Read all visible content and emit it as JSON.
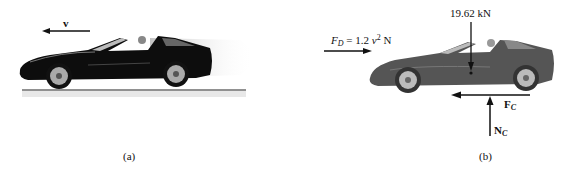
{
  "figure": {
    "panels": [
      {
        "id": "a",
        "caption": "(a)",
        "velocity_label": "v",
        "description": "Black sports car moving left with velocity v on a road surface"
      },
      {
        "id": "b",
        "caption": "(b)",
        "drag_force": {
          "symbol": "F",
          "subscript": "D",
          "equals": "= 1.2",
          "variable": "v",
          "power": "2",
          "unit": "N"
        },
        "weight_label": "19.62 kN",
        "friction_force": {
          "symbol": "F",
          "subscript": "C"
        },
        "normal_force": {
          "symbol": "N",
          "subscript": "C"
        },
        "description": "Free-body diagram of the car with drag, weight, friction and normal forces"
      }
    ],
    "colors": {
      "car_a": "#0d0d0d",
      "car_b": "#555555",
      "arrow": "#111111",
      "shadow": "#cfcfcf"
    }
  }
}
